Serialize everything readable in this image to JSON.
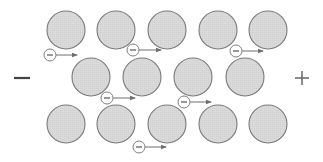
{
  "diagram": {
    "terminals": {
      "negative": {
        "label": "−",
        "x": 22,
        "y": 78
      },
      "positive": {
        "label": "+",
        "x": 302,
        "y": 78
      }
    },
    "colors": {
      "ion_fill": "#d9d9d9",
      "ion_stroke": "#7a7a7a",
      "electron_fill": "#ffffff",
      "electron_stroke": "#808080",
      "arrow": "#6e6e6e",
      "sign": "#555555"
    },
    "ion_radius": 19,
    "ions": [
      {
        "row": 1,
        "cx": 66,
        "cy": 30
      },
      {
        "row": 1,
        "cx": 116,
        "cy": 30
      },
      {
        "row": 1,
        "cx": 167,
        "cy": 30
      },
      {
        "row": 1,
        "cx": 218,
        "cy": 30
      },
      {
        "row": 1,
        "cx": 268,
        "cy": 30
      },
      {
        "row": 2,
        "cx": 91,
        "cy": 77
      },
      {
        "row": 2,
        "cx": 142,
        "cy": 77
      },
      {
        "row": 2,
        "cx": 193,
        "cy": 77
      },
      {
        "row": 2,
        "cx": 245,
        "cy": 77
      },
      {
        "row": 3,
        "cx": 66,
        "cy": 124
      },
      {
        "row": 3,
        "cx": 116,
        "cy": 124
      },
      {
        "row": 3,
        "cx": 167,
        "cy": 124
      },
      {
        "row": 3,
        "cx": 218,
        "cy": 124
      },
      {
        "row": 3,
        "cx": 268,
        "cy": 124
      }
    ],
    "electron_radius": 6,
    "electron_label": "−",
    "electrons": [
      {
        "cx": 50,
        "cy": 55,
        "arrow_to": 77
      },
      {
        "cx": 133,
        "cy": 50,
        "arrow_to": 161
      },
      {
        "cx": 236,
        "cy": 51,
        "arrow_to": 263
      },
      {
        "cx": 107,
        "cy": 98,
        "arrow_to": 135
      },
      {
        "cx": 184,
        "cy": 102,
        "arrow_to": 211
      },
      {
        "cx": 139,
        "cy": 147,
        "arrow_to": 166
      }
    ]
  }
}
